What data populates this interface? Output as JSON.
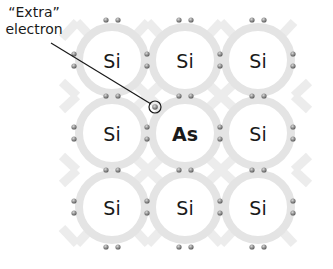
{
  "annotation": {
    "line1": "“Extra”",
    "line2": "electron"
  },
  "lattice": {
    "rows": [
      [
        "Si",
        "Si",
        "Si"
      ],
      [
        "Si",
        "As",
        "Si"
      ],
      [
        "Si",
        "Si",
        "Si"
      ]
    ],
    "dopant": "As",
    "host": "Si"
  },
  "colors": {
    "bond_ring": "#e6e6e6",
    "atom_core": "#ffffff",
    "electron": "#8a8a8a",
    "leader_line": "#1a1a1a"
  }
}
